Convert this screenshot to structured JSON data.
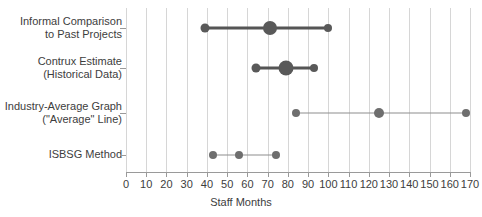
{
  "chart_data": {
    "type": "scatter",
    "title": "",
    "xlabel": "Staff Months",
    "ylabel": "",
    "xlim": [
      0,
      170
    ],
    "xticks": [
      0,
      10,
      20,
      30,
      40,
      50,
      60,
      70,
      80,
      90,
      100,
      110,
      120,
      130,
      140,
      150,
      160,
      170
    ],
    "xticklabels": [
      "0",
      "10",
      "20",
      "30",
      "40",
      "50",
      "60",
      "70",
      "80",
      "90",
      "100",
      "110",
      "120",
      "130",
      "140",
      "150",
      "160",
      "170"
    ],
    "grid": "vertical",
    "legend": "none",
    "categories": [
      "Informal Comparison\nto Past Projects",
      "Contrux Estimate\n(Historical Data)",
      "Industry-Average Graph\n(\"Average\" Line)",
      "ISBSG Method"
    ],
    "rows": [
      {
        "label": "Informal Comparison\nto Past Projects",
        "low": 39,
        "mid": 71,
        "high": 100,
        "emphasis": "heavy",
        "low_size": 9,
        "mid_size": 14,
        "high_size": 8
      },
      {
        "label": "Contrux Estimate\n(Historical Data)",
        "low": 64,
        "mid": 79,
        "high": 93,
        "emphasis": "heavy",
        "low_size": 9,
        "mid_size": 15,
        "high_size": 8
      },
      {
        "label": "Industry-Average Graph\n(\"Average\" Line)",
        "low": 84,
        "mid": 125,
        "high": 168,
        "emphasis": "light",
        "low_size": 8,
        "mid_size": 10,
        "high_size": 8
      },
      {
        "label": "ISBSG Method",
        "low": 43,
        "mid": 56,
        "high": 74,
        "emphasis": "light",
        "low_size": 8,
        "mid_size": 8,
        "high_size": 8
      }
    ],
    "colors": {
      "heavy_mark": "#595959",
      "light_mark": "#6e6e6e",
      "heavy_line": "#555555",
      "light_line": "#8e8e8e",
      "grid": "#d6d6d6",
      "axis": "#9a9a9a",
      "text": "#3d3d3d",
      "background": "#ffffff"
    }
  }
}
